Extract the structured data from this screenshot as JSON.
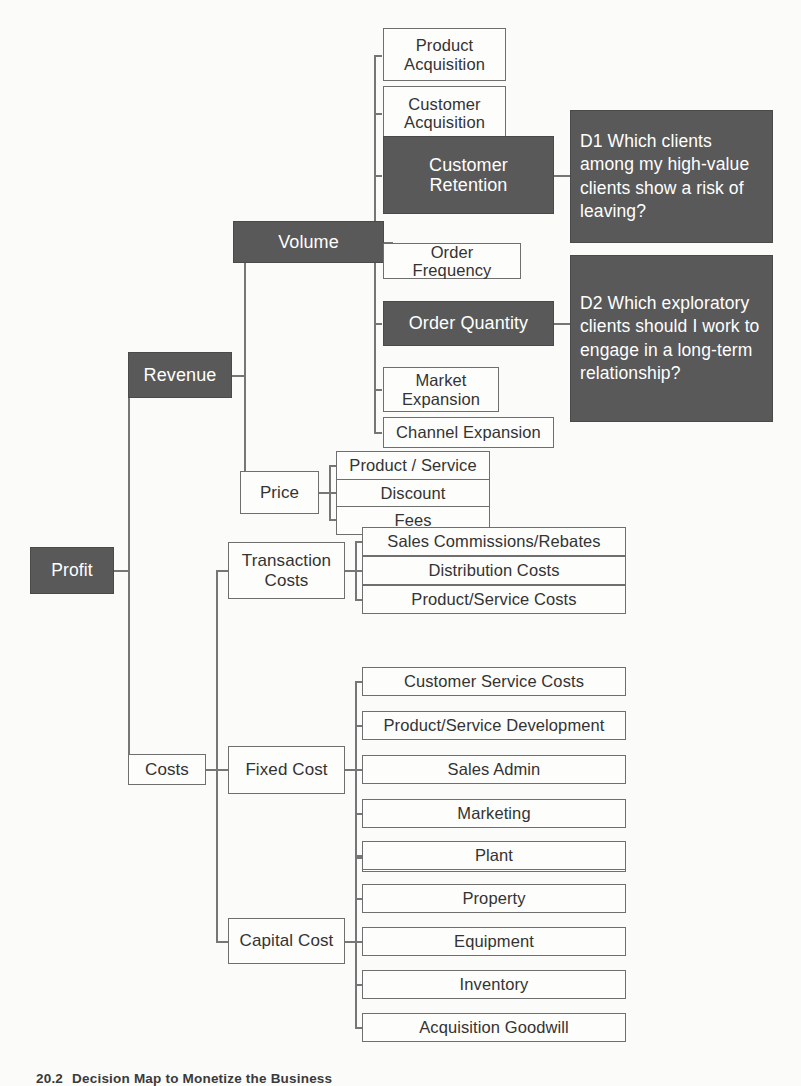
{
  "diagram": {
    "colors": {
      "dark_fill": "#595959",
      "light_fill": "#fdfdfc",
      "stroke": "#6f6f6f",
      "dark_text": "#ffffff",
      "light_text": "#333333",
      "background": "#fbfbfa"
    },
    "root": {
      "label": "Profit",
      "style": "dark"
    },
    "level1": [
      {
        "label": "Revenue",
        "style": "dark"
      },
      {
        "label": "Costs",
        "style": "light"
      }
    ],
    "level2": [
      {
        "label": "Volume",
        "style": "dark",
        "parent": "Revenue"
      },
      {
        "label": "Price",
        "style": "light",
        "parent": "Revenue"
      },
      {
        "label": "Transaction\nCosts",
        "style": "light",
        "parent": "Costs"
      },
      {
        "label": "Fixed Cost",
        "style": "light",
        "parent": "Costs"
      },
      {
        "label": "Capital Cost",
        "style": "light",
        "parent": "Costs"
      }
    ],
    "volume_children": [
      {
        "label": "Product\nAcquisition",
        "style": "light"
      },
      {
        "label": "Customer\nAcquisition",
        "style": "light"
      },
      {
        "label": "Customer\nRetention",
        "style": "dark"
      },
      {
        "label": "Order Frequency",
        "style": "light"
      },
      {
        "label": "Order Quantity",
        "style": "dark"
      },
      {
        "label": "Market\nExpansion",
        "style": "light"
      },
      {
        "label": "Channel Expansion",
        "style": "light"
      }
    ],
    "price_children": [
      {
        "label": "Product / Service",
        "style": "light"
      },
      {
        "label": "Discount",
        "style": "light"
      },
      {
        "label": "Fees",
        "style": "light"
      }
    ],
    "transaction_costs_children": [
      {
        "label": "Sales Commissions/Rebates",
        "style": "light"
      },
      {
        "label": "Distribution Costs",
        "style": "light"
      },
      {
        "label": "Product/Service Costs",
        "style": "light"
      }
    ],
    "fixed_cost_children": [
      {
        "label": "Customer Service Costs",
        "style": "light"
      },
      {
        "label": "Product/Service Development",
        "style": "light"
      },
      {
        "label": "Sales Admin",
        "style": "light"
      },
      {
        "label": "Marketing",
        "style": "light"
      },
      {
        "label": "Back Office/Administration",
        "style": "light"
      }
    ],
    "capital_cost_children": [
      {
        "label": "Plant",
        "style": "light"
      },
      {
        "label": "Property",
        "style": "light"
      },
      {
        "label": "Equipment",
        "style": "light"
      },
      {
        "label": "Inventory",
        "style": "light"
      },
      {
        "label": "Acquisition Goodwill",
        "style": "light"
      }
    ],
    "decision_notes": [
      {
        "id": "D1",
        "label": "D1 Which clients among my high-value clients show a risk of leaving?",
        "style": "dark",
        "attached_to": "Customer Retention"
      },
      {
        "id": "D2",
        "label": "D2 Which exploratory clients should I work to engage in a long-term relationship?",
        "style": "dark",
        "attached_to": "Order Quantity"
      }
    ]
  },
  "caption": {
    "figure_number": "20.2",
    "text": "Decision Map to Monetize the Business"
  }
}
